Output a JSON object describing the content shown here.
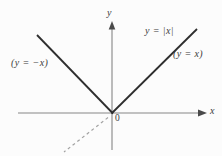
{
  "figure": {
    "curve_label": "y = |x|",
    "right_branch_label": "(y = x)",
    "left_branch_label": "(y = −x)",
    "axis": {
      "x": "x",
      "y": "y",
      "origin": "0"
    },
    "graph": {
      "type": "line",
      "curves": [
        {
          "equation": "y = -x",
          "domain": "x <= 0",
          "style": "solid"
        },
        {
          "equation": "y = x",
          "domain": "x >= 0",
          "style": "solid"
        },
        {
          "equation": "y = x",
          "domain": "x < 0",
          "style": "dashed"
        }
      ]
    },
    "colors": {
      "curve": "#2e2e2e",
      "axis": "#858585",
      "arrow": "#4a4a4a",
      "dashed": "#a3a3a3",
      "text": "#3b3b3b",
      "background": "#fcfcfc"
    }
  }
}
